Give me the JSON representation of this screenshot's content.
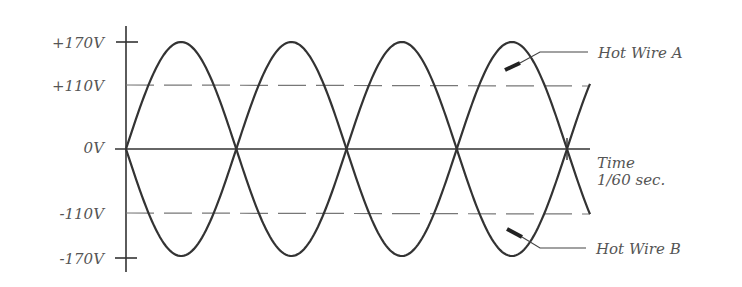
{
  "diagram": {
    "title": "",
    "y_labels": [
      {
        "text": "+170V",
        "value": 170
      },
      {
        "text": "+110V",
        "value": 110
      },
      {
        "text": "0V",
        "value": 0
      },
      {
        "text": "-110V",
        "value": -110
      },
      {
        "text": "-170V",
        "value": -170
      }
    ],
    "time_label_line1": "Time",
    "time_label_line2": "1/60 sec.",
    "wire_a_label": "Hot Wire A",
    "wire_b_label": "Hot Wire B",
    "colors": {
      "line": "#333333",
      "dashed": "#777777",
      "text": "#555555"
    }
  },
  "chart_data": {
    "type": "line",
    "title": "",
    "xlabel": "Time (1/60 sec.)",
    "ylabel": "Voltage",
    "ylim": [
      -170,
      170
    ],
    "yticks": [
      -170,
      -110,
      0,
      110,
      170
    ],
    "reference_lines": [
      110,
      -110
    ],
    "series": [
      {
        "name": "Hot Wire A",
        "function": "170*sin(2*pi*60*t)",
        "peak": 170
      },
      {
        "name": "Hot Wire B",
        "function": "-170*sin(2*pi*60*t)",
        "peak": -170
      }
    ],
    "x_range_periods": 1
  }
}
